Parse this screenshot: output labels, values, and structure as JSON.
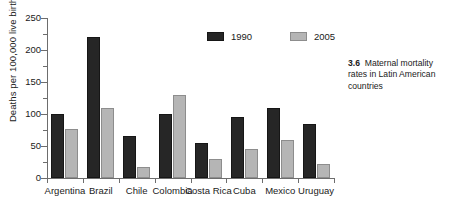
{
  "chart_data": {
    "type": "bar",
    "title": "",
    "xlabel": "",
    "ylabel": "Deaths per 100,000 live births",
    "ylim": [
      0,
      250
    ],
    "ytick_step": 50,
    "yticks": [
      0,
      50,
      100,
      150,
      200,
      250
    ],
    "ytick_labels": [
      "0",
      "50",
      "100",
      "150",
      "200",
      "250"
    ],
    "grid": false,
    "legend_position": "top-right",
    "categories": [
      "Argentina",
      "Brazil",
      "Chile",
      "Colombia",
      "Costa Rica",
      "Cuba",
      "Mexico",
      "Uruguay"
    ],
    "series": [
      {
        "name": "1990",
        "color": "#262626",
        "values": [
          100,
          220,
          65,
          100,
          55,
          95,
          110,
          85
        ]
      },
      {
        "name": "2005",
        "color": "#b5b5b5",
        "values": [
          77,
          110,
          17,
          130,
          30,
          45,
          60,
          22
        ]
      }
    ]
  },
  "legend": {
    "items": [
      {
        "label": "1990",
        "swatch": "dark"
      },
      {
        "label": "2005",
        "swatch": "light"
      }
    ]
  },
  "caption": {
    "number": "3.6",
    "text": "Maternal mortality rates in Latin American countries"
  }
}
